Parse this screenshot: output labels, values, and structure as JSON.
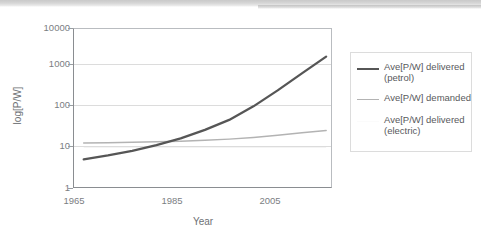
{
  "chart_data": {
    "type": "line",
    "title": "",
    "xlabel": "Year",
    "ylabel": "log[P/W]",
    "yscale": "log",
    "ylim": [
      1,
      10000
    ],
    "ytick_labels": [
      "10000",
      "1000",
      "100",
      "10",
      "1"
    ],
    "ytick_values": [
      10000,
      1000,
      100,
      10,
      1
    ],
    "xlim": [
      1963,
      2016
    ],
    "xtick_labels": [
      "1965",
      "1985",
      "2005"
    ],
    "xtick_values": [
      1965,
      1985,
      2005
    ],
    "grid": "horizontal",
    "legend_position": "right-outside",
    "x": [
      1965,
      1970,
      1975,
      1980,
      1985,
      1990,
      1995,
      2000,
      2005,
      2010,
      2015
    ],
    "series": [
      {
        "name": "Ave[P/W] delivered (petrol)",
        "color": "#565656",
        "width": 2.2,
        "values": [
          5.0,
          6.3,
          8.2,
          11.5,
          17.0,
          28.0,
          50.0,
          110.0,
          280.0,
          750.0,
          2000.0
        ]
      },
      {
        "name": "Ave[P/W] demanded",
        "color": "#b3b3b3",
        "width": 1.4,
        "values": [
          13.0,
          13.2,
          13.5,
          13.9,
          14.4,
          15.2,
          16.3,
          18.0,
          20.5,
          23.5,
          27.0
        ]
      },
      {
        "name": "Ave[P/W] delivered (electric)",
        "color": "#f4f4f4",
        "width": 1.2,
        "values": [
          10.0,
          10.0,
          10.0,
          10.0,
          10.0,
          10.0,
          10.0,
          10.0,
          10.0,
          10.0,
          10.0
        ]
      }
    ]
  },
  "legend": {
    "entries": [
      {
        "label": "Ave[P/W] delivered\n(petrol)",
        "color": "#565656"
      },
      {
        "label": "Ave[P/W] demanded",
        "color": "#b3b3b3"
      },
      {
        "label": "Ave[P/W] delivered\n(electric)",
        "color": "#fbfbfb"
      }
    ]
  },
  "axes": {
    "y_title": "log[P/W]",
    "x_title": "Year",
    "y_ticks": [
      "10000",
      "1000",
      "100",
      "10",
      "1"
    ],
    "x_ticks": [
      "1965",
      "1985",
      "2005"
    ]
  }
}
